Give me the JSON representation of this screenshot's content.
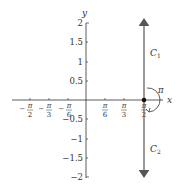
{
  "figure": {
    "axes": {
      "x_label": "x",
      "y_label": "y",
      "y_ticks": [
        {
          "label": "2",
          "value": 2
        },
        {
          "label": "1.5",
          "value": 1.5
        },
        {
          "label": "1",
          "value": 1
        },
        {
          "label": "0.5",
          "value": 0.5
        },
        {
          "label": "−0.5",
          "value": -0.5
        },
        {
          "label": "−1",
          "value": -1
        },
        {
          "label": "−1.5",
          "value": -1.5
        },
        {
          "label": "−2",
          "value": -2
        }
      ],
      "x_ticks": [
        {
          "sign": "−",
          "num": "π",
          "den": "2",
          "value": -1.5708
        },
        {
          "sign": "−",
          "num": "π",
          "den": "3",
          "value": -1.0472
        },
        {
          "sign": "−",
          "num": "π",
          "den": "6",
          "value": -0.5236
        },
        {
          "sign": "",
          "num": "π",
          "den": "6",
          "value": 0.5236
        },
        {
          "sign": "",
          "num": "π",
          "den": "3",
          "value": 1.0472
        },
        {
          "sign": "",
          "num": "π",
          "den": "2",
          "value": 1.5708
        }
      ]
    },
    "curves": {
      "c1_label": "C",
      "c1_sub": "1",
      "c2_label": "C",
      "c2_sub": "2"
    },
    "angle_label": "π",
    "point": {
      "x": 1.5708,
      "y": 0
    }
  }
}
